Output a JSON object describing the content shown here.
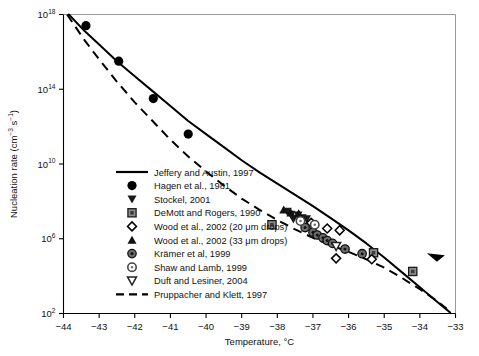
{
  "chart_data": {
    "type": "scatter",
    "title": "",
    "xlabel": "Temperature, °C",
    "ylabel": "Nucleation rate (cm⁻³ s⁻¹)",
    "ylabel_parts": {
      "base": "Nucleation rate (cm",
      "sup1": "−3",
      "mid": " s",
      "sup2": "−1",
      "tail": ")"
    },
    "xlim": [
      -44,
      -33
    ],
    "ylim_exponent": [
      2,
      18
    ],
    "yscale": "log",
    "grid": false,
    "xticks": [
      -44,
      -43,
      -42,
      -41,
      -40,
      -39,
      -38,
      -37,
      -36,
      -35,
      -34,
      -33
    ],
    "xticklabels": [
      "−44",
      "−43",
      "−42",
      "−41",
      "−40",
      "−39",
      "−38",
      "−37",
      "−36",
      "−35",
      "−34",
      "−33"
    ],
    "yticks_exponent": [
      2,
      6,
      10,
      14,
      18
    ],
    "yticklabels": [
      "10",
      "10",
      "10",
      "10",
      "10"
    ],
    "yticklabel_exponents": [
      "2",
      "6",
      "10",
      "14",
      "18"
    ],
    "legend_position": "inner-lower-left",
    "series": [
      {
        "name": "Jeffery and Austin, 1997",
        "marker": "line-solid",
        "color": "#000000",
        "points": [
          [
            -43.85,
            18.0
          ],
          [
            -43.4,
            17.1
          ],
          [
            -43.0,
            16.4
          ],
          [
            -42.5,
            15.5
          ],
          [
            -42.0,
            14.7
          ],
          [
            -41.5,
            13.9
          ],
          [
            -41.0,
            13.1
          ],
          [
            -40.5,
            12.3
          ],
          [
            -40.0,
            11.6
          ],
          [
            -39.5,
            10.9
          ],
          [
            -39.0,
            10.2
          ],
          [
            -38.5,
            9.55
          ],
          [
            -38.0,
            8.95
          ],
          [
            -37.5,
            8.35
          ],
          [
            -37.0,
            7.75
          ],
          [
            -36.5,
            7.1
          ],
          [
            -36.0,
            6.45
          ],
          [
            -35.5,
            5.75
          ],
          [
            -35.0,
            5.0
          ],
          [
            -34.5,
            4.2
          ],
          [
            -34.0,
            3.4
          ],
          [
            -33.5,
            2.6
          ],
          [
            -33.15,
            2.05
          ]
        ]
      },
      {
        "name": "Pruppacher and Klett, 1997",
        "marker": "line-dashed",
        "color": "#000000",
        "points": [
          [
            -43.9,
            18.0
          ],
          [
            -43.4,
            16.6
          ],
          [
            -43.0,
            15.6
          ],
          [
            -42.5,
            14.4
          ],
          [
            -42.0,
            13.3
          ],
          [
            -41.5,
            12.3
          ],
          [
            -41.0,
            11.3
          ],
          [
            -40.5,
            10.4
          ],
          [
            -40.0,
            9.6
          ],
          [
            -39.5,
            8.85
          ],
          [
            -39.0,
            8.15
          ],
          [
            -38.5,
            7.55
          ],
          [
            -38.0,
            7.0
          ],
          [
            -37.5,
            6.5
          ],
          [
            -37.0,
            6.05
          ],
          [
            -36.5,
            5.65
          ],
          [
            -36.0,
            5.3
          ],
          [
            -35.5,
            4.9
          ],
          [
            -35.0,
            4.45
          ],
          [
            -34.5,
            3.9
          ],
          [
            -34.0,
            3.3
          ],
          [
            -33.5,
            2.65
          ],
          [
            -33.15,
            2.1
          ]
        ]
      },
      {
        "name": "Hagen et al., 1981",
        "marker": "circle-filled",
        "color": "#000000",
        "points": [
          [
            -43.37,
            17.4
          ],
          [
            -42.45,
            15.5
          ],
          [
            -41.48,
            13.5
          ],
          [
            -40.5,
            11.6
          ]
        ]
      },
      {
        "name": "Stockel, 2001",
        "marker": "triangle-down-filled",
        "color": "#1a1a1a",
        "points": [
          [
            -37.72,
            7.45
          ],
          [
            -37.62,
            7.3
          ],
          [
            -37.55,
            7.05
          ],
          [
            -37.42,
            7.25
          ],
          [
            -37.3,
            7.1
          ],
          [
            -37.18,
            7.05
          ]
        ]
      },
      {
        "name": "DeMott and Rogers, 1990",
        "marker": "square-gray",
        "color": "#555555",
        "points": [
          [
            -38.15,
            6.75
          ],
          [
            -35.3,
            5.25
          ],
          [
            -34.2,
            4.25
          ]
        ]
      },
      {
        "name": "Wood et al., 2002 (20 μm drops)",
        "marker": "diamond-open",
        "color": "#000000",
        "points": [
          [
            -37.05,
            6.85
          ],
          [
            -36.6,
            6.55
          ],
          [
            -36.25,
            6.45
          ],
          [
            -36.35,
            4.95
          ],
          [
            -35.35,
            4.9
          ]
        ]
      },
      {
        "name": "Wood et al., 2002 (33 μm drops)",
        "marker": "triangle-up-filled",
        "color": "#111111",
        "points": [
          [
            -37.82,
            7.55
          ],
          [
            -37.62,
            7.4
          ],
          [
            -37.4,
            7.35
          ]
        ]
      },
      {
        "name": "Krämer et al, 1999",
        "marker": "circle-gray-dot",
        "color": "#4a4a4a",
        "points": [
          [
            -37.22,
            6.6
          ],
          [
            -37.0,
            6.35
          ],
          [
            -36.88,
            6.2
          ],
          [
            -36.72,
            6.05
          ],
          [
            -36.6,
            5.9
          ],
          [
            -36.45,
            5.75
          ],
          [
            -36.1,
            5.45
          ],
          [
            -35.62,
            5.2
          ]
        ]
      },
      {
        "name": "Shaw and Lamb, 1999",
        "marker": "circle-open-gray",
        "color": "#555555",
        "points": [
          [
            -37.35,
            6.95
          ],
          [
            -36.95,
            6.75
          ]
        ]
      },
      {
        "name": "Duft and Lesiner, 2004",
        "marker": "triangle-down-open",
        "color": "#333333",
        "points": [
          [
            -36.35,
            5.6
          ]
        ]
      },
      {
        "name": "arrow-annotation",
        "marker": "arrow-filled",
        "color": "#000000",
        "points": [
          [
            -33.55,
            5.05
          ]
        ]
      }
    ]
  },
  "legend": {
    "items": [
      {
        "label": "Jeffery and Austin, 1997",
        "marker": "line-solid"
      },
      {
        "label": "Hagen et al., 1981",
        "marker": "circle-filled"
      },
      {
        "label": "Stockel, 2001",
        "marker": "triangle-down-filled"
      },
      {
        "label": "DeMott and Rogers, 1990",
        "marker": "square-gray"
      },
      {
        "label": "Wood et al., 2002 (20 μm drops)",
        "marker": "diamond-open"
      },
      {
        "label": "Wood et al., 2002 (33 μm drops)",
        "marker": "triangle-up-filled"
      },
      {
        "label": "Krämer et al, 1999",
        "marker": "circle-gray-dot"
      },
      {
        "label": "Shaw and Lamb, 1999",
        "marker": "circle-open-gray"
      },
      {
        "label": "Duft and Lesiner, 2004",
        "marker": "triangle-down-open"
      },
      {
        "label": "Pruppacher and Klett, 1997",
        "marker": "line-dashed"
      }
    ]
  },
  "colors": {
    "ink": "#000000",
    "gray_marker": "#555555",
    "frame": "#9a9a9a"
  }
}
